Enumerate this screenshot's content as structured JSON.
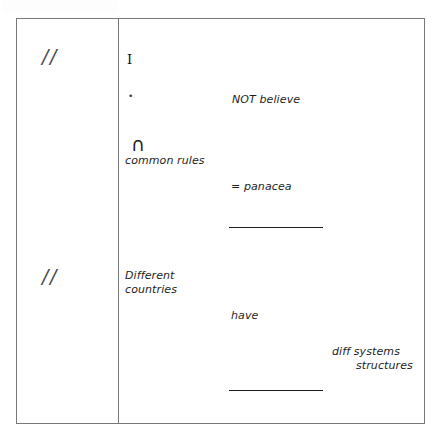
{
  "document": {
    "kind": "handwritten-notes-table",
    "background_color": "#ffffff",
    "ink_color": "#1e1e1e",
    "border_color": "#76787a"
  },
  "table": {
    "columns": 2,
    "rows": 2,
    "margin_column": {
      "marks": [
        {
          "name": "tally-top",
          "text": "//"
        },
        {
          "name": "tally-bottom",
          "text": "//"
        }
      ]
    },
    "body_column": {
      "row_one": {
        "glyph_i": "I",
        "glyph_dot": "•",
        "glyph_cap": "∩",
        "not_believe": "NOT believe",
        "common_rules": "common rules",
        "panacea": "= panacea"
      },
      "row_two": {
        "different_line1": "Different",
        "different_line2": "countries",
        "have": "have",
        "diff_systems_line1": "diff systems",
        "diff_systems_line2": "structures"
      }
    },
    "rules": [
      {
        "name": "rule-upper"
      },
      {
        "name": "rule-lower"
      }
    ]
  }
}
